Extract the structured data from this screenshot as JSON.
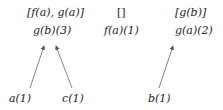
{
  "nodes": {
    "top_left": {
      "label": "[f(a), g(a)]",
      "sub": "g(b)(3)"
    },
    "top_middle": {
      "label": "[]",
      "sub": "f(a)(1)"
    },
    "top_right": {
      "label": "[g(b)]",
      "sub": "g(a)(2)"
    },
    "leaf_a": {
      "label": "a(1)"
    },
    "leaf_c": {
      "label": "c(1)"
    },
    "leaf_b": {
      "label": "b(1)"
    }
  },
  "edges": [
    {
      "from": "leaf_a",
      "to": "top_left"
    },
    {
      "from": "leaf_c",
      "to": "top_left"
    },
    {
      "from": "leaf_b",
      "to": "top_right"
    }
  ],
  "colors": {
    "text": "#222222",
    "line": "#555555",
    "background": "#ffffff"
  }
}
